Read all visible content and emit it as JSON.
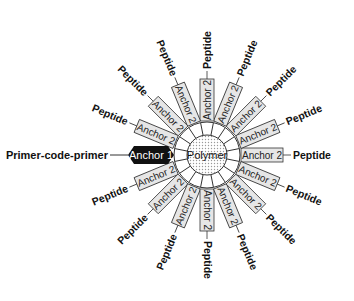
{
  "diagram": {
    "center_label": "Polymer",
    "anchor1": {
      "label": "Anchor 1",
      "attached_label": "Primer-code-primer"
    },
    "spokes": [
      {
        "angle": 0,
        "anchor": "Anchor 2",
        "peptide": "Peptide"
      },
      {
        "angle": 22.5,
        "anchor": "Anchor 2",
        "peptide": "Peptide"
      },
      {
        "angle": 45,
        "anchor": "Anchor 2",
        "peptide": "Peptide"
      },
      {
        "angle": 67.5,
        "anchor": "Anchor 2",
        "peptide": "Peptide"
      },
      {
        "angle": 90,
        "anchor": "Anchor 2",
        "peptide": "Peptide"
      },
      {
        "angle": 112.5,
        "anchor": "Anchor 2",
        "peptide": "Peptide"
      },
      {
        "angle": 135,
        "anchor": "Anchor 2",
        "peptide": "Peptide"
      },
      {
        "angle": 157.5,
        "anchor": "Anchor 2",
        "peptide": "Peptide"
      },
      {
        "angle": 202.5,
        "anchor": "Anchor 2",
        "peptide": "Peptide"
      },
      {
        "angle": 225,
        "anchor": "Anchor 2",
        "peptide": "Peptide"
      },
      {
        "angle": 247.5,
        "anchor": "Anchor 2",
        "peptide": "Peptide"
      },
      {
        "angle": 270,
        "anchor": "Anchor 2",
        "peptide": "Peptide"
      },
      {
        "angle": 292.5,
        "anchor": "Anchor 2",
        "peptide": "Peptide"
      },
      {
        "angle": 315,
        "anchor": "Anchor 2",
        "peptide": "Peptide"
      },
      {
        "angle": 337.5,
        "anchor": "Anchor 2",
        "peptide": "Peptide"
      }
    ],
    "colors": {
      "anchor2_fill": "#e6e6e6",
      "anchor1_fill": "#111111",
      "stroke": "#333333"
    }
  }
}
